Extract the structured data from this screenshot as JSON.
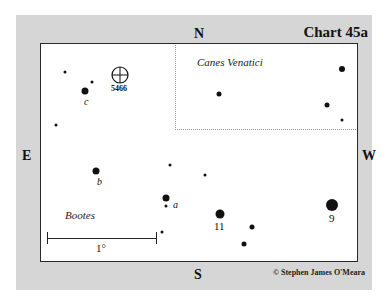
{
  "chart": {
    "title": "Chart 45a",
    "credit": "© Stephen James O'Meara",
    "directions": {
      "north": "N",
      "south": "S",
      "east": "E",
      "west": "W"
    },
    "constellations": [
      {
        "name": "Canes Venatici"
      },
      {
        "name": "Bootes"
      }
    ],
    "object": {
      "label": "5466",
      "type": "globular-cluster"
    },
    "scale_bar": {
      "label": "1°"
    },
    "star_labels": {
      "a": "a",
      "b": "b",
      "c": "c",
      "eleven": "11",
      "nine": "9"
    },
    "colors": {
      "panel": "#d6d6d6",
      "frame": "#ffffff",
      "ink": "#111111"
    }
  }
}
